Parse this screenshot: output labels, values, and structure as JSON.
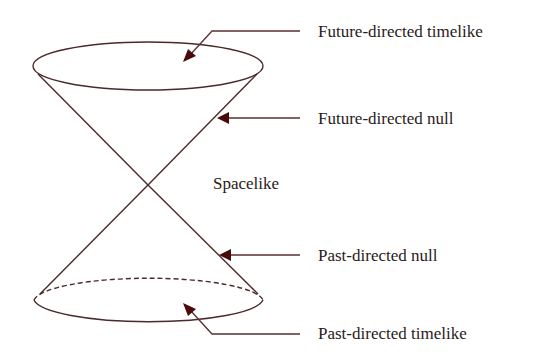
{
  "diagram": {
    "labels": {
      "future_timelike": "Future-directed timelike",
      "future_null": "Future-directed null",
      "spacelike": "Spacelike",
      "past_null": "Past-directed null",
      "past_timelike": "Past-directed timelike"
    },
    "colors": {
      "line": "#4a2a2a",
      "arrowhead": "#4a0a0a",
      "text": "#2a1a1a"
    }
  }
}
